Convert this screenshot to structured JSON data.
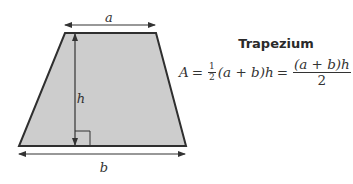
{
  "title": "Trapezium",
  "labels": {
    "top": "a",
    "bottom": "b",
    "height": "h"
  },
  "formula": {
    "lhs": "A",
    "eq1": "=",
    "half_num": "1",
    "half_den": "2",
    "middle": "(a + b)h",
    "eq2": "=",
    "frac_num": "(a + b)h",
    "frac_den": "2"
  },
  "colors": {
    "fill": "#cdcdcd",
    "stroke": "#2f2f2f",
    "text": "#333333"
  }
}
